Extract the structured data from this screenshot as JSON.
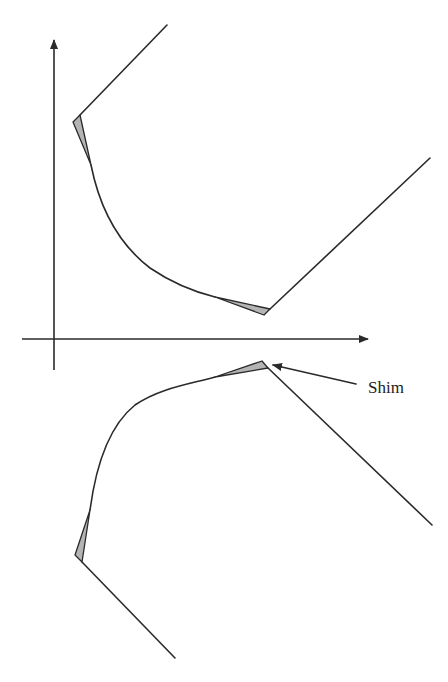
{
  "diagram": {
    "type": "hyperbolic-boundary-with-shims",
    "axes": {
      "x_axis": {
        "from": [
          22,
          339
        ],
        "to": [
          368,
          339
        ],
        "arrow": true
      },
      "y_axis": {
        "from": [
          54,
          370
        ],
        "to": [
          54,
          40
        ],
        "arrow": true
      }
    },
    "upper_branch": {
      "top_line": {
        "from": [
          167,
          25
        ],
        "to": [
          80,
          115
        ]
      },
      "curve": "M91,165 C100,210 120,245 150,268 C175,285 195,292 215,297",
      "right_line": {
        "from": [
          270,
          309
        ],
        "to": [
          430,
          158
        ]
      },
      "shims": [
        {
          "points": [
            [
              73,
              122
            ],
            [
              80,
              115
            ],
            [
              91,
              165
            ]
          ]
        },
        {
          "points": [
            [
              215,
              297
            ],
            [
              264,
              315
            ],
            [
              270,
              309
            ]
          ]
        }
      ]
    },
    "lower_branch": {
      "right_line": {
        "from": [
          268,
          368
        ],
        "to": [
          432,
          525
        ]
      },
      "curve": "M215,377 C190,384 160,388 135,405 C110,425 96,465 90,510",
      "bottom_line": {
        "from": [
          82,
          562
        ],
        "to": [
          175,
          658
        ]
      },
      "shims": [
        {
          "points": [
            [
              215,
              377
            ],
            [
              262,
              361
            ],
            [
              268,
              368
            ]
          ]
        },
        {
          "points": [
            [
              90,
              510
            ],
            [
              75,
              555
            ],
            [
              82,
              562
            ]
          ]
        }
      ]
    },
    "annotation": {
      "label": "Shim",
      "arrow_from": [
        356,
        384
      ],
      "arrow_to": [
        273,
        365
      ],
      "label_pos": [
        368,
        393
      ]
    },
    "colors": {
      "stroke": "#2a2a2a",
      "shim_fill": "#b4b4b4",
      "background": "#ffffff"
    }
  }
}
